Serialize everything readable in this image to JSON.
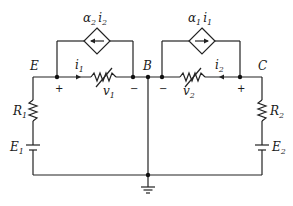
{
  "diagram": {
    "type": "circuit",
    "nodes": {
      "E": "E",
      "B": "B",
      "C": "C"
    },
    "sources": {
      "left_dependent": {
        "coef": "α",
        "coef_sub": "2",
        "var": "i",
        "var_sub": "2"
      },
      "right_dependent": {
        "coef": "α",
        "coef_sub": "1",
        "var": "i",
        "var_sub": "1"
      }
    },
    "currents": {
      "i1": {
        "main": "i",
        "sub": "1"
      },
      "i2": {
        "main": "i",
        "sub": "2"
      }
    },
    "voltages": {
      "v1": {
        "main": "v",
        "sub": "1"
      },
      "v2": {
        "main": "v",
        "sub": "2"
      }
    },
    "resistors": {
      "R1": {
        "main": "R",
        "sub": "1"
      },
      "R2": {
        "main": "R",
        "sub": "2"
      }
    },
    "batteries": {
      "E1": {
        "main": "E",
        "sub": "1"
      },
      "E2": {
        "main": "E",
        "sub": "2"
      }
    },
    "signs": {
      "plus": "+",
      "minus": "−"
    }
  }
}
